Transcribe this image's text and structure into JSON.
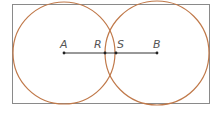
{
  "diagram": {
    "type": "geometry",
    "colors": {
      "rectangle": "#8a8a8a",
      "circles": "#c0794a",
      "segment": "#333333",
      "labels": "#555555"
    },
    "rectangle": {
      "x": 12,
      "y": 4,
      "width": 197,
      "height": 99
    },
    "circles": [
      {
        "name": "circle-a",
        "cx": 64,
        "cy": 53,
        "r": 51
      },
      {
        "name": "circle-b",
        "cx": 157,
        "cy": 53,
        "r": 52
      }
    ],
    "segment": {
      "x1": 64,
      "y1": 53,
      "x2": 157,
      "y2": 53
    },
    "points": [
      {
        "label": "A",
        "x": 64,
        "y": 53,
        "lx": 60,
        "ly": 48
      },
      {
        "label": "R",
        "x": 105,
        "y": 53,
        "lx": 94,
        "ly": 48
      },
      {
        "label": "S",
        "x": 116,
        "y": 53,
        "lx": 117,
        "ly": 48
      },
      {
        "label": "B",
        "x": 157,
        "y": 53,
        "lx": 153,
        "ly": 48
      }
    ]
  }
}
